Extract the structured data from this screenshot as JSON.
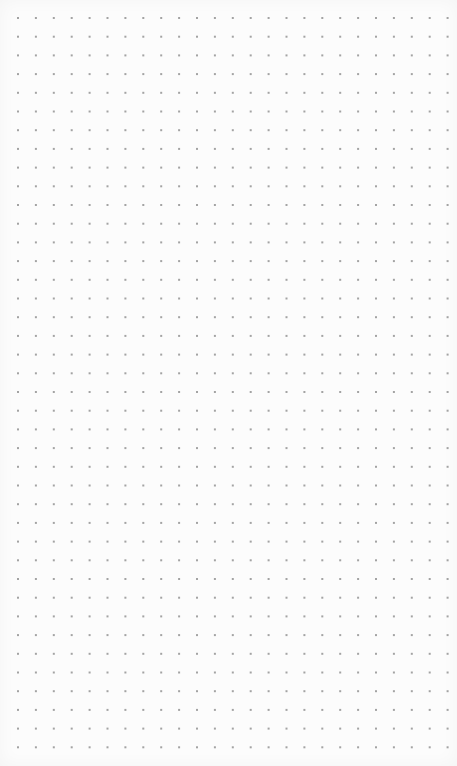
{
  "canvas": {
    "width": 457,
    "height": 766,
    "background_color": "#fcfcfc"
  },
  "dot_grid": {
    "columns": 25,
    "rows": 40,
    "origin_x": 18,
    "origin_y": 18,
    "spacing_x": 17.9,
    "spacing_y": 18.7,
    "dot_size": 2,
    "dot_color": "#a3a3a3"
  }
}
